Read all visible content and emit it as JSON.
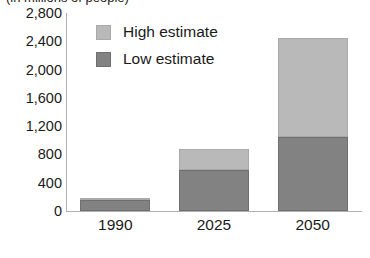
{
  "chart_data": {
    "type": "bar",
    "subtype": "stacked-bar",
    "title": "",
    "axis_title_truncated": "(in millions of people)",
    "xlabel": "",
    "ylabel": "",
    "categories": [
      "1990",
      "2025",
      "2050"
    ],
    "series": [
      {
        "name": "Low estimate",
        "color": "#828282",
        "values": [
          160,
          580,
          1050
        ]
      },
      {
        "name": "High estimate",
        "color": "#b9b9b9",
        "values": [
          20,
          295,
          1400
        ]
      }
    ],
    "stack_totals": [
      180,
      875,
      2450
    ],
    "ylim": [
      0,
      2800
    ],
    "ytick_step": 400,
    "ytick_labels": [
      "2,800",
      "2,400",
      "2,000",
      "1,600",
      "1,200",
      "800",
      "400",
      "0"
    ],
    "ytick_values": [
      2800,
      2400,
      2000,
      1600,
      1200,
      800,
      400,
      0
    ],
    "grid": false,
    "legend_position": "top-left-inside",
    "legend_entries": [
      "High estimate",
      "Low estimate"
    ]
  },
  "legend": {
    "items": [
      {
        "label": "High estimate",
        "swatch": "legend-swatch-high"
      },
      {
        "label": "Low estimate",
        "swatch": "legend-swatch-low"
      }
    ]
  }
}
